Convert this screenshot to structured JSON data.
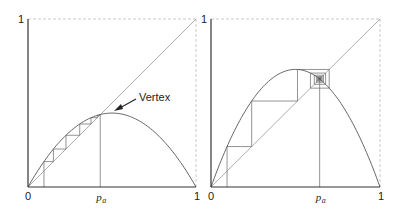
{
  "chart_data": [
    {
      "type": "line",
      "title": "",
      "xlabel": "",
      "ylabel": "",
      "xlim": [
        0,
        1
      ],
      "ylim": [
        0,
        1
      ],
      "grid": false,
      "x_tick_labels": [
        "0",
        "p_a",
        "1"
      ],
      "y_tick_labels": [
        "1"
      ],
      "series": [
        {
          "name": "logistic map f(p) = r p (1-p)",
          "r": 1.76
        },
        {
          "name": "diagonal y = x",
          "x": [
            0,
            1
          ],
          "y": [
            0,
            1
          ]
        },
        {
          "name": "cobweb iteration",
          "x0": 0.095,
          "steps": 8
        }
      ],
      "fixed_point_p_a": 0.43,
      "annotation": {
        "text": "Vertex",
        "points_to": [
          0.5,
          0.44
        ]
      }
    },
    {
      "type": "line",
      "title": "",
      "xlabel": "",
      "ylabel": "",
      "xlim": [
        0,
        1
      ],
      "ylim": [
        0,
        1
      ],
      "grid": false,
      "x_tick_labels": [
        "0",
        "p_a",
        "1"
      ],
      "y_tick_labels": [
        "1"
      ],
      "series": [
        {
          "name": "logistic map f(p) = r p (1-p)",
          "r": 2.8
        },
        {
          "name": "diagonal y = x",
          "x": [
            0,
            1
          ],
          "y": [
            0,
            1
          ]
        },
        {
          "name": "cobweb iteration",
          "x0": 0.095,
          "steps": 40
        }
      ],
      "fixed_point_p_a": 0.643
    }
  ],
  "labels": {
    "zero": "0",
    "one": "1",
    "p": "p",
    "a": "a",
    "vertex": "Vertex"
  }
}
